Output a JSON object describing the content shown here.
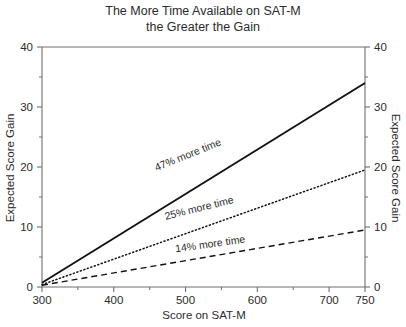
{
  "chart_data": {
    "type": "line",
    "title": "The More Time Available on SAT-M the Greater the Gain",
    "title_lines": [
      "The More Time Available on SAT-M",
      "the Greater the Gain"
    ],
    "xlabel": "Score on SAT-M",
    "ylabel": "Expected Score Gain",
    "ylabel_right": "Expected Score Gain",
    "xlim": [
      300,
      750
    ],
    "ylim": [
      0,
      40
    ],
    "x_ticks": [
      300,
      400,
      500,
      600,
      700,
      750
    ],
    "x_tick_labels": [
      "300",
      "400",
      "500",
      "600",
      "700",
      "750"
    ],
    "x_minor_ticks": [
      350,
      450,
      550,
      650
    ],
    "y_ticks": [
      0,
      10,
      20,
      30,
      40
    ],
    "y_tick_labels": [
      "0",
      "10",
      "20",
      "30",
      "40"
    ],
    "y_minor_ticks": [
      5,
      15,
      25,
      35
    ],
    "grid": false,
    "legend": "inline-labels",
    "series": [
      {
        "name": "47% more time",
        "style": "solid",
        "label": "47% more time",
        "label_x": 505,
        "label_y": 21.5,
        "label_rotation": -22,
        "x": [
          300,
          750
        ],
        "values": [
          0.7,
          34.0
        ]
      },
      {
        "name": "25% more time",
        "style": "dotted",
        "label": "25% more time",
        "label_x": 520,
        "label_y": 12.6,
        "label_rotation": -14,
        "x": [
          300,
          750
        ],
        "values": [
          0.4,
          19.5
        ]
      },
      {
        "name": "14% more time",
        "style": "dashed",
        "label": "14% more time",
        "label_x": 535,
        "label_y": 6.6,
        "label_rotation": -8,
        "x": [
          300,
          750
        ],
        "values": [
          0.3,
          9.5
        ]
      }
    ]
  },
  "colors": {
    "background": "#ffffff",
    "axis": "#6e6e6e",
    "line": "#111111",
    "text": "#2b2b2b"
  }
}
